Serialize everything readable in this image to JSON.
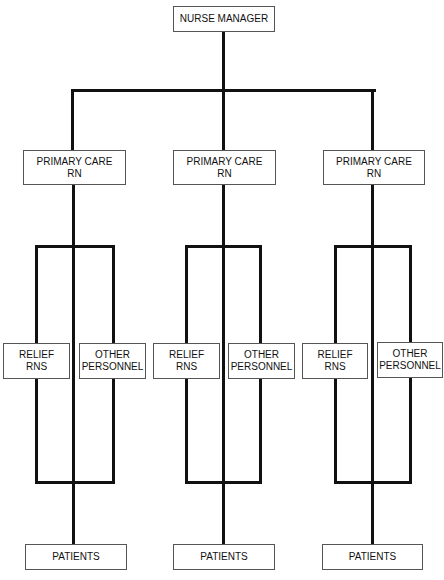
{
  "diagram": {
    "type": "org-chart",
    "root": {
      "label": "NURSE MANAGER"
    },
    "groups": [
      {
        "primary": {
          "line1": "PRIMARY CARE",
          "line2": "RN"
        },
        "relief": {
          "line1": "RELIEF",
          "line2": "RNS"
        },
        "other": {
          "line1": "OTHER",
          "line2": "PERSONNEL"
        },
        "patients": {
          "label": "PATIENTS"
        }
      },
      {
        "primary": {
          "line1": "PRIMARY CARE",
          "line2": "RN"
        },
        "relief": {
          "line1": "RELIEF",
          "line2": "RNS"
        },
        "other": {
          "line1": "OTHER",
          "line2": "PERSONNEL"
        },
        "patients": {
          "label": "PATIENTS"
        }
      },
      {
        "primary": {
          "line1": "PRIMARY CARE",
          "line2": "RN"
        },
        "relief": {
          "line1": "RELIEF",
          "line2": "RNS"
        },
        "other": {
          "line1": "OTHER",
          "line2": "PERSONNEL"
        },
        "patients": {
          "label": "PATIENTS"
        }
      }
    ]
  }
}
